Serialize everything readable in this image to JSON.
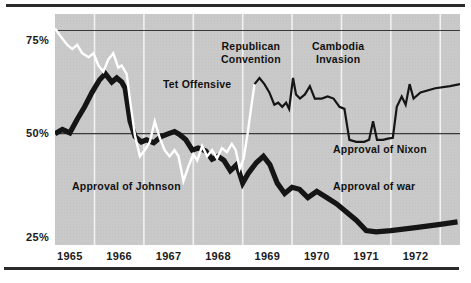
{
  "figure": {
    "title": "",
    "border_color": "#2b2b2b",
    "plot_background": "#c9c9c9"
  },
  "axis": {
    "y_ticks": [
      {
        "label": "75%",
        "value": 75
      },
      {
        "label": "50%",
        "value": 50
      },
      {
        "label": "25%",
        "value": 25
      }
    ],
    "x_ticks": [
      {
        "label": "1965",
        "value": 1965
      },
      {
        "label": "1966",
        "value": 1966
      },
      {
        "label": "1967",
        "value": 1967
      },
      {
        "label": "1968",
        "value": 1968
      },
      {
        "label": "1969",
        "value": 1969
      },
      {
        "label": "1970",
        "value": 1970
      },
      {
        "label": "1971",
        "value": 1971
      },
      {
        "label": "1972",
        "value": 1972
      }
    ]
  },
  "annotations": {
    "republican_convention": "Republican\nConvention",
    "republican_convention_line1": "Republican",
    "republican_convention_line2": "Convention",
    "cambodia_invasion_line1": "Cambodia",
    "cambodia_invasion_line2": "Invasion",
    "tet_offensive": "Tet Offensive",
    "approval_of_nixon": "Approval of Nixon",
    "approval_of_war": "Approval of war",
    "approval_of_johnson": "Approval of Johnson"
  },
  "chart_data": {
    "type": "line",
    "title": "",
    "xlabel": "",
    "ylabel": "",
    "xlim": [
      1964.7,
      1972.9
    ],
    "ylim": [
      23,
      79
    ],
    "grid": "vertical white year gridlines; horizontal dark rules at 50% and 75%",
    "legend": "inline annotations",
    "y_tick_values": [
      25,
      50,
      75
    ],
    "x_tick_values": [
      1965,
      1966,
      1967,
      1968,
      1969,
      1970,
      1971,
      1972
    ],
    "series": [
      {
        "name": "Approval of war",
        "style": "thick black line",
        "color": "#151515",
        "points": [
          [
            1964.7,
            50.0
          ],
          [
            1964.85,
            51.0
          ],
          [
            1965.0,
            50.2
          ],
          [
            1965.15,
            53.5
          ],
          [
            1965.3,
            56.5
          ],
          [
            1965.45,
            60.0
          ],
          [
            1965.6,
            63.0
          ],
          [
            1965.72,
            64.5
          ],
          [
            1965.85,
            62.5
          ],
          [
            1965.95,
            63.5
          ],
          [
            1966.05,
            62.5
          ],
          [
            1966.12,
            61.0
          ],
          [
            1966.22,
            53.0
          ],
          [
            1966.32,
            49.3
          ],
          [
            1966.45,
            48.0
          ],
          [
            1966.55,
            48.5
          ],
          [
            1966.7,
            47.8
          ],
          [
            1966.85,
            49.3
          ],
          [
            1967.0,
            50.0
          ],
          [
            1967.12,
            50.5
          ],
          [
            1967.22,
            49.8
          ],
          [
            1967.35,
            48.5
          ],
          [
            1967.48,
            46.0
          ],
          [
            1967.6,
            46.5
          ],
          [
            1967.75,
            45.8
          ],
          [
            1967.88,
            43.8
          ],
          [
            1968.0,
            44.5
          ],
          [
            1968.12,
            43.5
          ],
          [
            1968.25,
            41.0
          ],
          [
            1968.38,
            42.5
          ],
          [
            1968.5,
            38.0
          ],
          [
            1968.62,
            40.5
          ],
          [
            1968.78,
            43.0
          ],
          [
            1968.92,
            44.5
          ],
          [
            1969.05,
            42.5
          ],
          [
            1969.2,
            38.0
          ],
          [
            1969.35,
            35.5
          ],
          [
            1969.5,
            37.0
          ],
          [
            1969.65,
            36.5
          ],
          [
            1969.82,
            34.5
          ],
          [
            1970.0,
            36.0
          ],
          [
            1970.2,
            34.5
          ],
          [
            1970.4,
            33.0
          ],
          [
            1970.6,
            31.0
          ],
          [
            1970.8,
            29.0
          ],
          [
            1971.0,
            26.5
          ],
          [
            1971.2,
            26.2
          ],
          [
            1971.5,
            26.5
          ],
          [
            1972.0,
            27.2
          ],
          [
            1972.5,
            28.0
          ],
          [
            1972.85,
            28.6
          ]
        ]
      },
      {
        "name": "Approval of Johnson",
        "style": "white line",
        "color": "#ffffff",
        "points": [
          [
            1964.7,
            75.5
          ],
          [
            1964.82,
            73.5
          ],
          [
            1964.95,
            71.5
          ],
          [
            1965.05,
            70.5
          ],
          [
            1965.15,
            71.5
          ],
          [
            1965.25,
            69.5
          ],
          [
            1965.38,
            68.5
          ],
          [
            1965.48,
            69.5
          ],
          [
            1965.58,
            66.5
          ],
          [
            1965.68,
            65.0
          ],
          [
            1965.78,
            68.0
          ],
          [
            1965.88,
            69.5
          ],
          [
            1965.98,
            66.0
          ],
          [
            1966.05,
            66.5
          ],
          [
            1966.15,
            64.5
          ],
          [
            1966.22,
            58.0
          ],
          [
            1966.32,
            49.5
          ],
          [
            1966.42,
            44.5
          ],
          [
            1966.52,
            46.0
          ],
          [
            1966.62,
            48.0
          ],
          [
            1966.72,
            53.0
          ],
          [
            1966.82,
            49.0
          ],
          [
            1966.92,
            46.0
          ],
          [
            1967.02,
            44.5
          ],
          [
            1967.12,
            46.0
          ],
          [
            1967.2,
            44.5
          ],
          [
            1967.3,
            38.5
          ],
          [
            1967.4,
            42.0
          ],
          [
            1967.5,
            45.0
          ],
          [
            1967.58,
            43.5
          ],
          [
            1967.68,
            47.0
          ],
          [
            1967.78,
            44.5
          ],
          [
            1967.88,
            46.0
          ],
          [
            1967.98,
            44.0
          ],
          [
            1968.08,
            46.5
          ],
          [
            1968.18,
            45.5
          ],
          [
            1968.28,
            47.5
          ],
          [
            1968.36,
            46.0
          ],
          [
            1968.44,
            41.5
          ],
          [
            1968.52,
            44.0
          ],
          [
            1968.6,
            50.0
          ],
          [
            1968.68,
            57.0
          ],
          [
            1968.74,
            62.0
          ]
        ]
      },
      {
        "name": "Approval of Nixon",
        "style": "thin black line",
        "color": "#151515",
        "points": [
          [
            1968.74,
            62.0
          ],
          [
            1968.84,
            63.5
          ],
          [
            1968.94,
            62.0
          ],
          [
            1969.04,
            60.0
          ],
          [
            1969.14,
            57.0
          ],
          [
            1969.22,
            57.5
          ],
          [
            1969.3,
            56.5
          ],
          [
            1969.38,
            57.5
          ],
          [
            1969.44,
            56.0
          ],
          [
            1969.52,
            63.5
          ],
          [
            1969.58,
            59.5
          ],
          [
            1969.66,
            58.5
          ],
          [
            1969.76,
            59.5
          ],
          [
            1969.86,
            61.5
          ],
          [
            1969.96,
            58.5
          ],
          [
            1970.1,
            58.5
          ],
          [
            1970.22,
            59.0
          ],
          [
            1970.34,
            58.5
          ],
          [
            1970.46,
            56.5
          ],
          [
            1970.56,
            56.0
          ],
          [
            1970.66,
            48.5
          ],
          [
            1970.8,
            48.0
          ],
          [
            1970.96,
            48.0
          ],
          [
            1971.06,
            48.5
          ],
          [
            1971.14,
            53.0
          ],
          [
            1971.22,
            48.5
          ],
          [
            1971.34,
            48.5
          ],
          [
            1971.44,
            48.8
          ],
          [
            1971.54,
            49.0
          ],
          [
            1971.62,
            56.5
          ],
          [
            1971.72,
            59.0
          ],
          [
            1971.8,
            57.0
          ],
          [
            1971.88,
            62.0
          ],
          [
            1971.96,
            58.5
          ],
          [
            1972.1,
            60.0
          ],
          [
            1972.4,
            61.0
          ],
          [
            1972.7,
            61.5
          ],
          [
            1972.9,
            62.0
          ]
        ]
      }
    ]
  }
}
